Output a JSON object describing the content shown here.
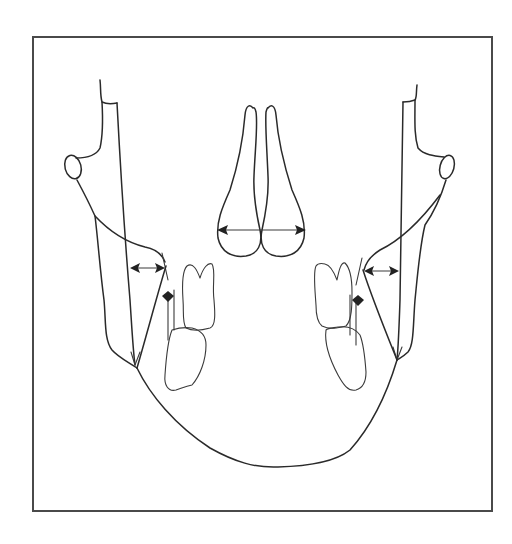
{
  "figure": {
    "colors": {
      "line": "#2a2a2a",
      "frame": "#4a4a4a",
      "background": "#ffffff"
    },
    "elements": [
      {
        "name": "nasal-cavity",
        "measurement": "nasal width arrow"
      },
      {
        "name": "left-ramus",
        "measurement": "left ramus-to-molar arrow"
      },
      {
        "name": "right-ramus",
        "measurement": "right ramus-to-molar arrow"
      },
      {
        "name": "left-molars",
        "measurement": "left dental marker"
      },
      {
        "name": "right-molars",
        "measurement": "right dental marker"
      },
      {
        "name": "mandible-outline"
      }
    ]
  }
}
